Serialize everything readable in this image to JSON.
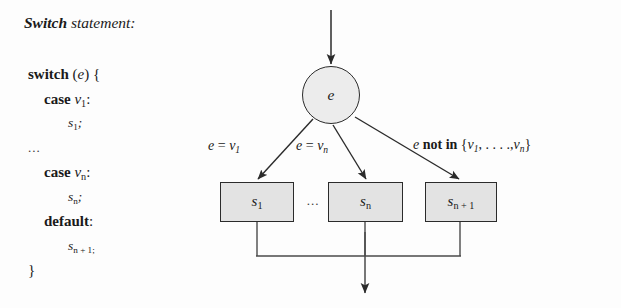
{
  "heading": {
    "keyword": "Switch",
    "rest": " statement:"
  },
  "code": {
    "lines": [
      {
        "kw": "switch",
        "rest": " (e) {",
        "indent": 0
      },
      {
        "kw": "case",
        "rest": " v1:",
        "indent": 1
      },
      {
        "kw": "",
        "rest": "s1;",
        "indent": 2
      },
      {
        "kw": "",
        "rest": "...",
        "indent": 0
      },
      {
        "kw": "case",
        "rest": " vn:",
        "indent": 1
      },
      {
        "kw": "",
        "rest": "sn;",
        "indent": 2
      },
      {
        "kw": "default",
        "rest": ":",
        "indent": 1
      },
      {
        "kw": "",
        "rest": "sn + 1;",
        "indent": 2
      },
      {
        "kw": "",
        "rest": "}",
        "indent": 0
      }
    ],
    "ellipsis": "...",
    "switch_kw": "switch",
    "case_kw": "case",
    "default_kw": "default",
    "open_paren_e": "(",
    "close_brace": "}"
  },
  "diagram": {
    "decision_node_label": "e",
    "boxes": [
      {
        "name": "s1",
        "base": "s",
        "sub": "1"
      },
      {
        "name": "sn",
        "base": "s",
        "sub": "n"
      },
      {
        "name": "sn+1",
        "base": "s",
        "sub": "n + 1"
      }
    ],
    "box_ellipsis": "...",
    "edge_labels": [
      {
        "id": "edge-v1",
        "text": "e = v1"
      },
      {
        "id": "edge-vn",
        "text": "e = vn"
      },
      {
        "id": "edge-not",
        "text": "e not in {v1, . . . .,vn}"
      }
    ],
    "edge_label_parts": {
      "e": "e",
      "equals": " = ",
      "v": "v",
      "sub1": "1",
      "subn": "n",
      "not_in": "not in",
      "open_set": "{",
      "dots": ", . . . .,",
      "close_set": "}"
    },
    "colors": {
      "box_fill": "#e3e3e3",
      "circle_fill": "#ececec",
      "stroke": "#2b2b2b",
      "background": "#fdfdfd"
    }
  }
}
